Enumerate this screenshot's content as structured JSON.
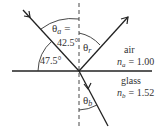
{
  "diagram": {
    "type": "refraction-reflection",
    "media": {
      "upper": {
        "name": "air",
        "index_label": "n",
        "index_sub": "a",
        "index_value": "= 1.00"
      },
      "lower": {
        "name": "glass",
        "index_label": "n",
        "index_sub": "b",
        "index_value": "= 1.52"
      }
    },
    "angles": {
      "theta_a": {
        "symbol": "θ",
        "sub": "a",
        "eq": "=",
        "value": "42.5°"
      },
      "theta_r": {
        "symbol": "θ",
        "sub": "r"
      },
      "theta_b": {
        "symbol": "θ",
        "sub": "b"
      },
      "surface_angle": {
        "value": "47.5°"
      }
    },
    "colors": {
      "line": "#222222",
      "text": "#333333",
      "background": "#ffffff"
    }
  }
}
